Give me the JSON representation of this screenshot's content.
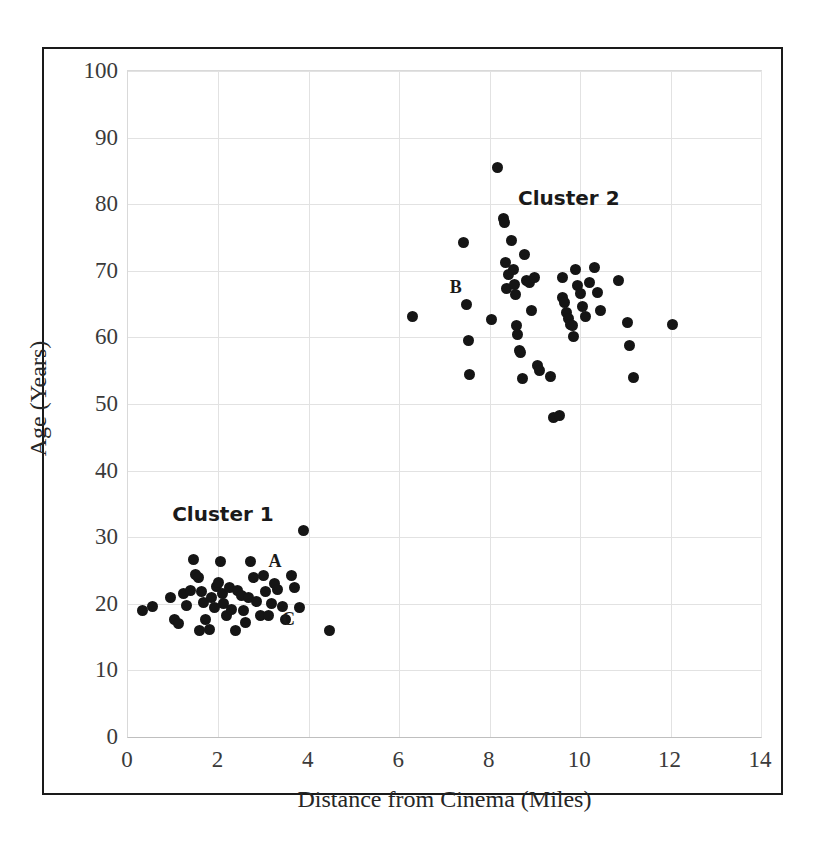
{
  "chart_data": {
    "type": "scatter",
    "title": "",
    "xlabel": "Distance from Cinema (Miles)",
    "ylabel": "Age (Years)",
    "xlim": [
      0,
      14
    ],
    "ylim": [
      0,
      100
    ],
    "xticks": [
      0,
      2,
      4,
      6,
      8,
      10,
      12,
      14
    ],
    "yticks": [
      0,
      10,
      20,
      30,
      40,
      50,
      60,
      70,
      80,
      90,
      100
    ],
    "grid": true,
    "legend": "none",
    "marker_color": "#151515",
    "annotations": [
      {
        "text": "Cluster 1",
        "x": 2.1,
        "y": 33.5
      },
      {
        "text": "Cluster 2",
        "x": 9.75,
        "y": 81.0
      },
      {
        "text": "A",
        "x": 3.25,
        "y": 26.5
      },
      {
        "text": "B",
        "x": 7.25,
        "y": 67.5
      },
      {
        "text": "C",
        "x": 3.55,
        "y": 17.7
      }
    ],
    "series": [
      {
        "name": "Cluster 1",
        "points": [
          [
            0.32,
            19.0
          ],
          [
            0.55,
            19.6
          ],
          [
            0.95,
            21.0
          ],
          [
            1.02,
            17.6
          ],
          [
            1.12,
            17.0
          ],
          [
            1.22,
            21.5
          ],
          [
            1.3,
            19.8
          ],
          [
            1.38,
            22.0
          ],
          [
            1.45,
            26.6
          ],
          [
            1.5,
            24.4
          ],
          [
            1.55,
            23.9
          ],
          [
            1.58,
            16.0
          ],
          [
            1.62,
            21.9
          ],
          [
            1.68,
            20.2
          ],
          [
            1.72,
            17.6
          ],
          [
            1.8,
            16.2
          ],
          [
            1.85,
            21.0
          ],
          [
            1.92,
            19.4
          ],
          [
            1.95,
            22.6
          ],
          [
            2.0,
            23.2
          ],
          [
            2.05,
            26.3
          ],
          [
            2.1,
            21.5
          ],
          [
            2.12,
            20.0
          ],
          [
            2.18,
            18.2
          ],
          [
            2.25,
            22.4
          ],
          [
            2.3,
            19.2
          ],
          [
            2.38,
            16.0
          ],
          [
            2.42,
            22.0
          ],
          [
            2.5,
            21.2
          ],
          [
            2.55,
            19.0
          ],
          [
            2.6,
            17.2
          ],
          [
            2.66,
            21.0
          ],
          [
            2.72,
            26.4
          ],
          [
            2.78,
            23.9
          ],
          [
            2.85,
            20.3
          ],
          [
            2.92,
            18.2
          ],
          [
            3.0,
            24.2
          ],
          [
            3.05,
            21.8
          ],
          [
            3.1,
            18.2
          ],
          [
            3.18,
            20.1
          ],
          [
            3.25,
            23.0
          ],
          [
            3.3,
            22.2
          ],
          [
            3.42,
            19.6
          ],
          [
            3.48,
            17.6
          ],
          [
            3.62,
            24.3
          ],
          [
            3.68,
            22.4
          ],
          [
            3.8,
            19.5
          ],
          [
            3.88,
            31.0
          ],
          [
            4.45,
            16.0
          ]
        ]
      },
      {
        "name": "Cluster 2",
        "points": [
          [
            6.3,
            63.2
          ],
          [
            7.42,
            74.2
          ],
          [
            7.48,
            65.0
          ],
          [
            7.52,
            59.6
          ],
          [
            7.55,
            54.4
          ],
          [
            8.05,
            62.7
          ],
          [
            8.18,
            85.5
          ],
          [
            8.3,
            77.8
          ],
          [
            8.32,
            77.2
          ],
          [
            8.35,
            71.2
          ],
          [
            8.38,
            67.4
          ],
          [
            8.42,
            69.4
          ],
          [
            8.48,
            74.6
          ],
          [
            8.52,
            70.2
          ],
          [
            8.55,
            68.0
          ],
          [
            8.58,
            66.5
          ],
          [
            8.6,
            61.8
          ],
          [
            8.62,
            60.5
          ],
          [
            8.65,
            58.0
          ],
          [
            8.68,
            57.8
          ],
          [
            8.72,
            53.8
          ],
          [
            8.78,
            72.5
          ],
          [
            8.82,
            68.6
          ],
          [
            8.88,
            68.2
          ],
          [
            8.92,
            64.0
          ],
          [
            9.0,
            69.0
          ],
          [
            9.05,
            55.8
          ],
          [
            9.1,
            55.0
          ],
          [
            9.35,
            54.2
          ],
          [
            9.42,
            48.0
          ],
          [
            9.55,
            48.2
          ],
          [
            9.6,
            69.0
          ],
          [
            9.62,
            66.0
          ],
          [
            9.66,
            65.2
          ],
          [
            9.7,
            63.8
          ],
          [
            9.74,
            62.8
          ],
          [
            9.78,
            62.0
          ],
          [
            9.82,
            61.8
          ],
          [
            9.86,
            60.2
          ],
          [
            9.9,
            70.2
          ],
          [
            9.95,
            67.8
          ],
          [
            10.0,
            66.6
          ],
          [
            10.05,
            64.6
          ],
          [
            10.12,
            63.2
          ],
          [
            10.2,
            68.2
          ],
          [
            10.32,
            70.5
          ],
          [
            10.38,
            66.8
          ],
          [
            10.45,
            64.0
          ],
          [
            10.85,
            68.5
          ],
          [
            11.05,
            62.2
          ],
          [
            11.1,
            58.8
          ],
          [
            11.18,
            54.0
          ],
          [
            12.05,
            62.0
          ]
        ]
      }
    ]
  },
  "axis": {
    "x_title": "Distance from Cinema (Miles)",
    "y_title": "Age (Years)"
  }
}
